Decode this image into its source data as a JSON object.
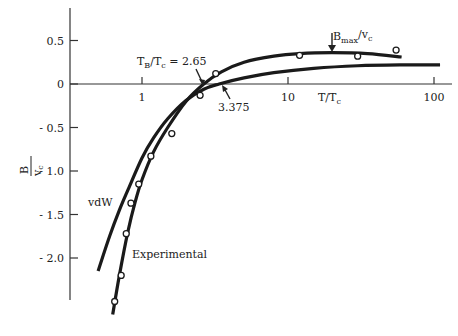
{
  "chart_data": {
    "type": "line",
    "title": "",
    "xlabel": "T/T_c",
    "ylabel": "B/v_c",
    "xscale": "log",
    "xlim": [
      0.4,
      130
    ],
    "ylim": [
      -2.6,
      0.8
    ],
    "grid": false,
    "legend": "inline labels",
    "x_ticks": [
      {
        "value": 1,
        "label": "1"
      },
      {
        "value": 10,
        "label": "10"
      },
      {
        "value": 100,
        "label": "100"
      }
    ],
    "y_ticks": [
      {
        "value": 0.5,
        "label": "0.5"
      },
      {
        "value": 0,
        "label": "0"
      },
      {
        "value": -0.5,
        "label": "- 0.5"
      },
      {
        "value": -1.0,
        "label": "- 1.0"
      },
      {
        "value": -1.5,
        "label": "- 1.5"
      },
      {
        "value": -2.0,
        "label": "- 2.0"
      }
    ],
    "series": [
      {
        "name": "Experimental",
        "kind": "curve",
        "x": [
          0.63,
          0.7,
          0.8,
          0.9,
          1.0,
          1.2,
          1.5,
          2.0,
          2.65,
          3.5,
          5,
          8,
          12,
          20,
          35,
          60
        ],
        "y": [
          -2.65,
          -2.2,
          -1.7,
          -1.35,
          -1.1,
          -0.78,
          -0.5,
          -0.2,
          0.0,
          0.14,
          0.25,
          0.32,
          0.35,
          0.36,
          0.35,
          0.31
        ]
      },
      {
        "name": "vdW",
        "kind": "curve",
        "x": [
          0.5,
          0.6,
          0.7,
          0.8,
          1.0,
          1.2,
          1.5,
          2.0,
          2.65,
          3.375,
          5,
          8,
          15,
          30,
          60,
          110
        ],
        "y": [
          -2.15,
          -1.75,
          -1.45,
          -1.22,
          -0.85,
          -0.62,
          -0.4,
          -0.19,
          -0.06,
          0.0,
          0.07,
          0.13,
          0.18,
          0.21,
          0.22,
          0.22
        ]
      },
      {
        "name": "Experimental data points",
        "kind": "scatter",
        "x": [
          0.65,
          0.72,
          0.78,
          0.84,
          0.95,
          1.15,
          1.6,
          2.5,
          3.2,
          12,
          30,
          55
        ],
        "y": [
          -2.5,
          -2.2,
          -1.72,
          -1.37,
          -1.15,
          -0.83,
          -0.57,
          -0.13,
          0.12,
          0.33,
          0.32,
          0.39
        ]
      }
    ],
    "annotations": [
      {
        "text": "T_B/T_c = 2.65",
        "points_to": {
          "x": 2.65,
          "y": 0
        }
      },
      {
        "text": "3.375",
        "points_to": {
          "x": 3.375,
          "y": 0
        }
      },
      {
        "text": "B_max/v_c",
        "points_to": {
          "x": 20,
          "y": 0.36
        }
      },
      {
        "text": "vdW",
        "labels_series": "vdW"
      },
      {
        "text": "Experimental",
        "labels_series": "Experimental"
      }
    ]
  },
  "labels": {
    "xaxis": "T/T",
    "xaxis_sub": "c",
    "yaxis_num": "B",
    "yaxis_den": "v",
    "yaxis_den_sub": "c",
    "tb_main": "T",
    "tb_sub": "B",
    "tb_mid": "/T",
    "tb_sub2": "c",
    "tb_val": " = 2.65",
    "vdw_boyle": "3.375",
    "bmax_main": "B",
    "bmax_sub": "max",
    "bmax_mid": "/v",
    "bmax_sub2": "c",
    "vdw": "vdW",
    "experimental": "Experimental"
  }
}
